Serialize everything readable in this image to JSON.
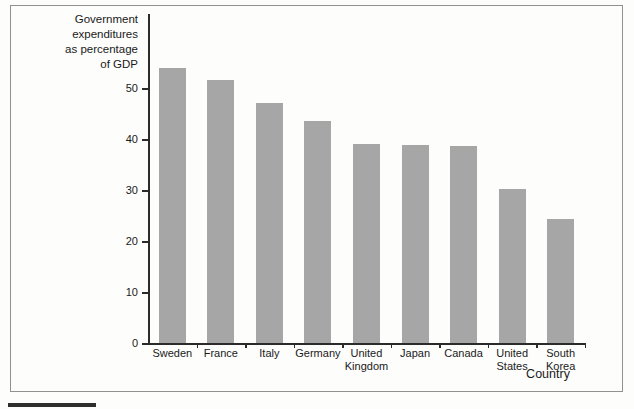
{
  "figure": {
    "background_color": "#fdfdfc",
    "frame_border_color": "#919191",
    "figure_tab_color": "#2e2e2e"
  },
  "chart_data": {
    "type": "bar",
    "title": "Government expenditures as percentage of GDP",
    "title_lines": [
      "Government",
      "expenditures",
      "as percentage",
      "of GDP"
    ],
    "xlabel": "Country",
    "ylabel": "Government expenditures as percentage of GDP",
    "categories": [
      "Sweden",
      "France",
      "Italy",
      "Germany",
      "United Kingdom",
      "Japan",
      "Canada",
      "United States",
      "South Korea"
    ],
    "category_label_lines": [
      [
        "Sweden"
      ],
      [
        "France"
      ],
      [
        "Italy"
      ],
      [
        "Germany"
      ],
      [
        "United",
        "Kingdom"
      ],
      [
        "Japan"
      ],
      [
        "Canada"
      ],
      [
        "United",
        "States"
      ],
      [
        "South",
        "Korea"
      ]
    ],
    "values": [
      54,
      51.5,
      47,
      43.5,
      39,
      38.9,
      38.6,
      30.2,
      24.4
    ],
    "yticks": [
      0,
      10,
      20,
      30,
      40,
      50
    ],
    "ylim": [
      0,
      64.5
    ],
    "grid": false,
    "legend_position": "none",
    "bar_color": "#a6a6a6",
    "axis_color": "#2b2b2b",
    "text_color": "#1a1a1a"
  }
}
